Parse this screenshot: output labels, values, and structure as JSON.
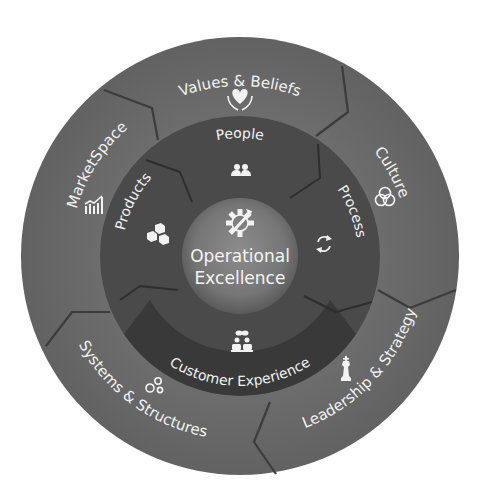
{
  "diagram": {
    "center": {
      "title_line1": "Operational",
      "title_line2": "Excellence",
      "icon": "gear-wrench-icon"
    },
    "inner_ring": [
      {
        "label": "People",
        "icon": "people-icon"
      },
      {
        "label": "Process",
        "icon": "cycle-arrows-icon"
      },
      {
        "label": "Customer Experience",
        "icon": "customer-conversation-icon"
      },
      {
        "label": "Products",
        "icon": "boxes-icon"
      }
    ],
    "outer_ring": [
      {
        "label": "Values & Beliefs",
        "icon": "heart-hands-icon"
      },
      {
        "label": "Culture",
        "icon": "interlocked-rings-icon"
      },
      {
        "label": "Leadership & Strategy",
        "icon": "chess-king-icon"
      },
      {
        "label": "Systems & Structures",
        "icon": "gears-icon"
      },
      {
        "label": "MarketSpace",
        "icon": "bar-chart-growth-icon"
      }
    ],
    "colors": {
      "outer_ring": "#686868",
      "inner_ring": "#4a4a4a",
      "customer_segment": "#383838",
      "center": "#7c7c7c",
      "text": "#f2f2f2"
    }
  }
}
